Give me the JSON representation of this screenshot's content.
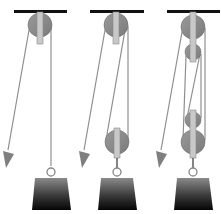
{
  "diagram": {
    "description": "Three pulley systems side by side with increasing mechanical advantage",
    "colors": {
      "ceiling": "#111111",
      "pulley": "#8c8c8c",
      "pulley_edge": "#6e6e6e",
      "bracket": "#c8c8c8",
      "bracket_edge": "#8a8a8a",
      "rope": "#8f8f8f",
      "arrow": "#7f7f7f",
      "hook": "#333333",
      "ring": "#888888",
      "weight_top": "#8a8a8a",
      "weight_bottom": "#0a0a0a"
    },
    "panels": [
      {
        "name": "single-fixed-pulley",
        "pulleys": 1,
        "rope_segments_supporting_load": 1
      },
      {
        "name": "fixed-and-movable-pulley",
        "pulleys": 2,
        "rope_segments_supporting_load": 2
      },
      {
        "name": "double-block-and-tackle",
        "pulleys": 4,
        "rope_segments_supporting_load": 4
      }
    ]
  }
}
